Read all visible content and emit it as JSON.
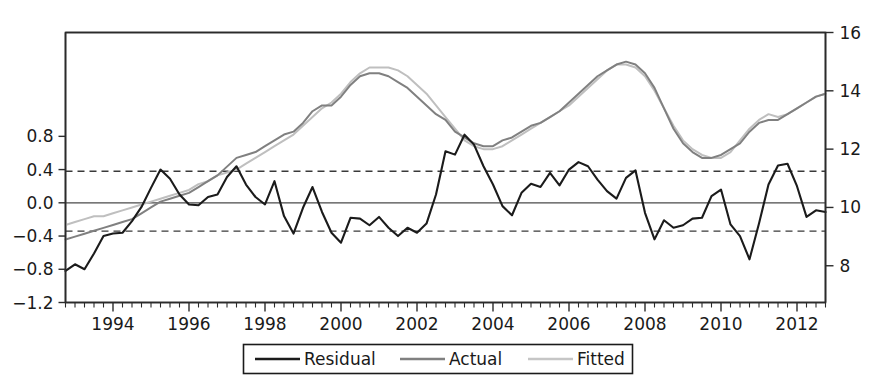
{
  "chart_data": {
    "type": "line",
    "title": "",
    "subtitle": "",
    "xlabel": "",
    "ylabel": "",
    "grid": false,
    "legend_position": "bottom",
    "legend": [
      "Residual",
      "Actual",
      "Fitted"
    ],
    "colors": {
      "residual": "#1b1b1b",
      "actual": "#808080",
      "fitted": "#bfbfbf",
      "axis": "#2b2b2b",
      "band": "#3a3a3a",
      "background": "#ffffff"
    },
    "axes": {
      "x": {
        "label": "",
        "range": [
          1992.75,
          2012.75
        ],
        "major_ticks": [
          1994,
          1996,
          1998,
          2000,
          2002,
          2004,
          2006,
          2008,
          2010,
          2012
        ],
        "major_tick_labels": [
          "1994",
          "1996",
          "1998",
          "2000",
          "2002",
          "2004",
          "2006",
          "2008",
          "2010",
          "2012"
        ],
        "minor_tick_step": 0.25
      },
      "y_left": {
        "label": "",
        "range": [
          -1.2,
          2.05
        ],
        "ticks": [
          -1.2,
          -0.8,
          -0.4,
          0.0,
          0.4,
          0.8
        ],
        "tick_labels": [
          "−1.2",
          "−0.8",
          "−0.4",
          "0.0",
          "0.4",
          "0.8"
        ],
        "series": [
          "Residual"
        ]
      },
      "y_right": {
        "label": "",
        "range": [
          6.74,
          16.0
        ],
        "ticks": [
          8,
          10,
          12,
          14,
          16
        ],
        "tick_labels": [
          "8",
          "10",
          "12",
          "14",
          "16"
        ],
        "series": [
          "Actual",
          "Fitted"
        ]
      }
    },
    "reference_lines": [
      {
        "name": "upper-band",
        "axis": "y_left",
        "value": 0.38,
        "style": "dashed"
      },
      {
        "name": "lower-band",
        "axis": "y_left",
        "value": -0.34,
        "style": "dashed"
      },
      {
        "name": "zero-line",
        "axis": "y_left",
        "value": 0.0,
        "style": "solid"
      }
    ],
    "x": [
      1992.75,
      1993.0,
      1993.25,
      1993.5,
      1993.75,
      1994.0,
      1994.25,
      1994.5,
      1994.75,
      1995.0,
      1995.25,
      1995.5,
      1995.75,
      1996.0,
      1996.25,
      1996.5,
      1996.75,
      1997.0,
      1997.25,
      1997.5,
      1997.75,
      1998.0,
      1998.25,
      1998.5,
      1998.75,
      1999.0,
      1999.25,
      1999.5,
      1999.75,
      2000.0,
      2000.25,
      2000.5,
      2000.75,
      2001.0,
      2001.25,
      2001.5,
      2001.75,
      2002.0,
      2002.25,
      2002.5,
      2002.75,
      2003.0,
      2003.25,
      2003.5,
      2003.75,
      2004.0,
      2004.25,
      2004.5,
      2004.75,
      2005.0,
      2005.25,
      2005.5,
      2005.75,
      2006.0,
      2006.25,
      2006.5,
      2006.75,
      2007.0,
      2007.25,
      2007.5,
      2007.75,
      2008.0,
      2008.25,
      2008.5,
      2008.75,
      2009.0,
      2009.25,
      2009.5,
      2009.75,
      2010.0,
      2010.25,
      2010.5,
      2010.75,
      2011.0,
      2011.25,
      2011.5,
      2011.75,
      2012.0,
      2012.25,
      2012.5,
      2012.75
    ],
    "series": [
      {
        "name": "Residual",
        "axis": "y_left",
        "color": "#1b1b1b",
        "values": [
          -0.82,
          -0.74,
          -0.8,
          -0.61,
          -0.4,
          -0.37,
          -0.36,
          -0.22,
          -0.05,
          0.18,
          0.4,
          0.29,
          0.1,
          -0.02,
          -0.03,
          0.07,
          0.1,
          0.31,
          0.44,
          0.22,
          0.07,
          -0.02,
          0.26,
          -0.16,
          -0.37,
          -0.06,
          0.19,
          -0.11,
          -0.36,
          -0.48,
          -0.18,
          -0.19,
          -0.27,
          -0.17,
          -0.3,
          -0.4,
          -0.3,
          -0.36,
          -0.25,
          0.1,
          0.62,
          0.58,
          0.82,
          0.7,
          0.44,
          0.22,
          -0.04,
          -0.15,
          0.12,
          0.23,
          0.19,
          0.36,
          0.21,
          0.4,
          0.49,
          0.44,
          0.28,
          0.14,
          0.05,
          0.3,
          0.39,
          -0.12,
          -0.44,
          -0.21,
          -0.3,
          -0.27,
          -0.19,
          -0.18,
          0.08,
          0.16,
          -0.26,
          -0.4,
          -0.68,
          -0.25,
          0.22,
          0.45,
          0.47,
          0.2,
          -0.17,
          -0.09,
          -0.11
        ]
      },
      {
        "name": "Actual",
        "axis": "y_right",
        "color": "#808080",
        "values": [
          8.9,
          9.0,
          9.1,
          9.2,
          9.3,
          9.4,
          9.5,
          9.6,
          9.8,
          10.0,
          10.2,
          10.3,
          10.4,
          10.5,
          10.7,
          10.9,
          11.1,
          11.4,
          11.7,
          11.8,
          11.9,
          12.1,
          12.3,
          12.5,
          12.6,
          12.9,
          13.3,
          13.5,
          13.5,
          13.8,
          14.2,
          14.5,
          14.6,
          14.6,
          14.5,
          14.3,
          14.1,
          13.8,
          13.5,
          13.2,
          13.0,
          12.6,
          12.4,
          12.2,
          12.1,
          12.1,
          12.3,
          12.4,
          12.6,
          12.8,
          12.9,
          13.1,
          13.3,
          13.6,
          13.9,
          14.2,
          14.5,
          14.7,
          14.9,
          15.0,
          14.9,
          14.6,
          14.1,
          13.4,
          12.7,
          12.2,
          11.9,
          11.7,
          11.7,
          11.8,
          12.0,
          12.2,
          12.6,
          12.9,
          13.0,
          13.0,
          13.2,
          13.4,
          13.6,
          13.8,
          13.9
        ]
      },
      {
        "name": "Fitted",
        "axis": "y_right",
        "color": "#bfbfbf",
        "values": [
          9.4,
          9.5,
          9.6,
          9.7,
          9.7,
          9.8,
          9.9,
          10.0,
          10.1,
          10.2,
          10.3,
          10.4,
          10.5,
          10.6,
          10.8,
          10.9,
          11.1,
          11.2,
          11.3,
          11.5,
          11.7,
          11.9,
          12.1,
          12.3,
          12.5,
          12.8,
          13.1,
          13.4,
          13.6,
          13.9,
          14.3,
          14.6,
          14.8,
          14.8,
          14.8,
          14.7,
          14.5,
          14.2,
          13.9,
          13.5,
          13.1,
          12.7,
          12.3,
          12.1,
          12.0,
          12.0,
          12.1,
          12.3,
          12.5,
          12.7,
          12.9,
          13.1,
          13.3,
          13.5,
          13.8,
          14.1,
          14.4,
          14.7,
          14.9,
          14.9,
          14.8,
          14.5,
          14.0,
          13.4,
          12.8,
          12.3,
          12.0,
          11.8,
          11.7,
          11.7,
          11.9,
          12.3,
          12.7,
          13.0,
          13.2,
          13.1,
          13.2,
          13.4,
          13.6,
          13.8,
          13.9
        ]
      }
    ]
  },
  "legend": {
    "items": [
      {
        "label": "Residual",
        "swatch": "residual-line-swatch"
      },
      {
        "label": "Actual",
        "swatch": "actual-line-swatch"
      },
      {
        "label": "Fitted",
        "swatch": "fitted-line-swatch"
      }
    ]
  }
}
